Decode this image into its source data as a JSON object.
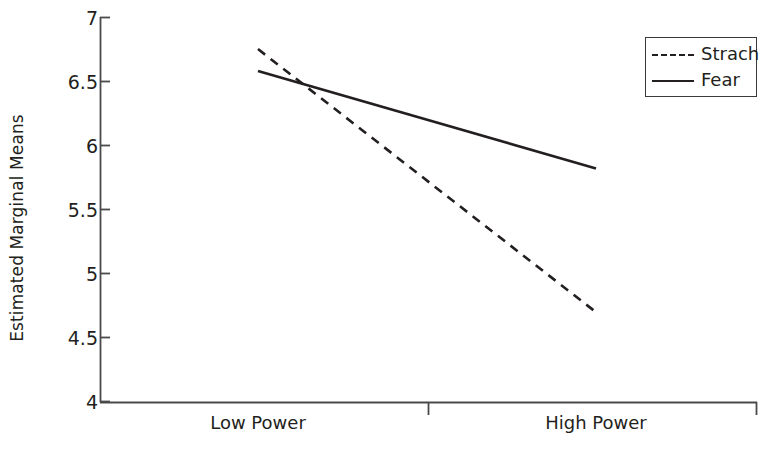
{
  "chart_data": {
    "type": "line",
    "title": "",
    "subtitle": "",
    "xlabel": "",
    "ylabel": "Estimated Marginal Means",
    "categories": [
      "Low Power",
      "High Power"
    ],
    "series": [
      {
        "name": "Strach",
        "values": [
          6.75,
          4.7
        ],
        "style": "dashed"
      },
      {
        "name": "Fear",
        "values": [
          6.58,
          5.82
        ],
        "style": "solid"
      }
    ],
    "ylim": [
      4,
      7
    ],
    "yticks": [
      "4",
      "4.5",
      "5",
      "5.5",
      "6",
      "6.5",
      "7"
    ],
    "ytick_values": [
      4,
      4.5,
      5,
      5.5,
      6,
      6.5,
      7
    ],
    "xticks": [
      "Low Power",
      "High Power"
    ],
    "grid": false,
    "legend_position": "top-right",
    "legend_entries": [
      "Strach",
      "Fear"
    ],
    "line_color": "#231f20",
    "axis_color": "#4a4a4a",
    "background": "#ffffff"
  },
  "axes": {
    "y_title": "Estimated Marginal Means",
    "y_tick_0": "4",
    "y_tick_1": "4.5",
    "y_tick_2": "5",
    "y_tick_3": "5.5",
    "y_tick_4": "6",
    "y_tick_5": "6.5",
    "y_tick_6": "7",
    "x_tick_0": "Low Power",
    "x_tick_1": "High Power"
  },
  "legend": {
    "items": [
      {
        "label": "Strach",
        "style": "dashed"
      },
      {
        "label": "Fear",
        "style": "solid"
      }
    ]
  }
}
